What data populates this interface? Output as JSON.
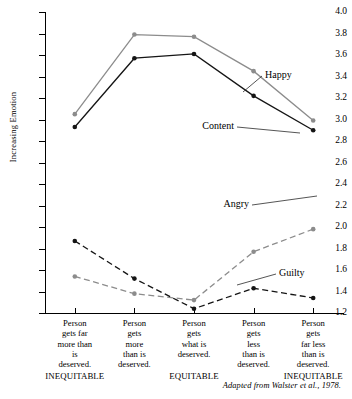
{
  "chart_data": {
    "type": "line",
    "title": "",
    "xlabel": "",
    "ylabel": "Increasing Emotion",
    "ylim": [
      1.2,
      4.0
    ],
    "ytick_step": 0.2,
    "yticks": [
      "4.0",
      "3.8",
      "3.6",
      "3.4",
      "3.2",
      "3.0",
      "2.8",
      "2.6",
      "2.4",
      "2.2",
      "2.0",
      "1.8",
      "1.6",
      "1.4",
      "1.2"
    ],
    "grid": false,
    "legend_position": "inline-annotations",
    "categories": [
      "Person gets far more than is deserved.",
      "Person gets more than is deserved.",
      "Person gets what is deserved.",
      "Person gets less than is deserved.",
      "Person gets far less than is deserved."
    ],
    "category_lines": [
      [
        "Person",
        "gets far",
        "more than",
        "is",
        "deserved."
      ],
      [
        "Person",
        "gets",
        "more",
        "than is",
        "deserved."
      ],
      [
        "Person",
        "gets",
        "what is",
        "deserved."
      ],
      [
        "Person",
        "gets",
        "less",
        "than is",
        "deserved."
      ],
      [
        "Person",
        "gets",
        "far less",
        "than is",
        "deserved."
      ]
    ],
    "equity_labels": [
      {
        "text": "INEQUITABLE",
        "category_index": 0
      },
      {
        "text": "EQUITABLE",
        "category_index": 2
      },
      {
        "text": "INEQUITABLE",
        "category_index": 4
      }
    ],
    "series": [
      {
        "name": "Happy",
        "values": [
          3.05,
          3.79,
          3.77,
          3.45,
          2.99
        ],
        "color": "#8c8c8c",
        "style": "solid"
      },
      {
        "name": "Content",
        "values": [
          2.93,
          3.57,
          3.61,
          3.22,
          2.9
        ],
        "color": "#151515",
        "style": "solid"
      },
      {
        "name": "Angry",
        "values": [
          1.54,
          1.38,
          1.32,
          1.77,
          1.98
        ],
        "color": "#8c8c8c",
        "style": "dashed"
      },
      {
        "name": "Guilty",
        "values": [
          1.87,
          1.52,
          1.24,
          1.43,
          1.34
        ],
        "color": "#151515",
        "style": "dashed"
      }
    ],
    "annotations": [
      {
        "label": "Happy",
        "series": "Happy"
      },
      {
        "label": "Content",
        "series": "Content"
      },
      {
        "label": "Angry",
        "series": "Angry"
      },
      {
        "label": "Guilty",
        "series": "Guilty"
      }
    ],
    "source_note": "Adapted from Walster et al., 1978."
  }
}
